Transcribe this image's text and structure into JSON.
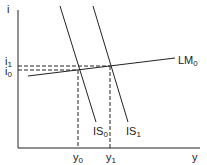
{
  "diagram": {
    "axes": {
      "y_label": "i",
      "x_label": "y"
    },
    "curves": [
      {
        "id": "LM0",
        "label": "LM",
        "sub": "0"
      },
      {
        "id": "IS0",
        "label": "IS",
        "sub": "0"
      },
      {
        "id": "IS1",
        "label": "IS",
        "sub": "1"
      }
    ],
    "levels": {
      "i1": {
        "label": "i",
        "sub": "1"
      },
      "i0": {
        "label": "i",
        "sub": "0"
      },
      "y0": {
        "label": "y",
        "sub": "0"
      },
      "y1": {
        "label": "y",
        "sub": "1"
      }
    }
  }
}
